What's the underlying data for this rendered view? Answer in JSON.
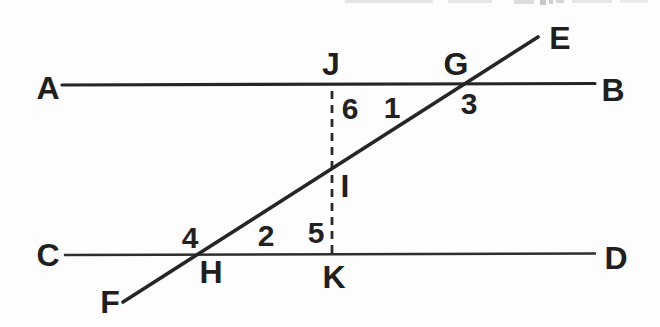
{
  "figure": {
    "description_colors": {
      "ink": "#262626",
      "label_ink": "#1f1f1f",
      "paper": "#fdfdfd",
      "scan_artifact": "#bfbfbf"
    },
    "lines": [
      {
        "name": "line-AB",
        "style": "solid"
      },
      {
        "name": "line-CD",
        "style": "solid"
      },
      {
        "name": "transversal-FE",
        "style": "solid"
      },
      {
        "name": "segment-JK",
        "style": "dashed"
      }
    ]
  },
  "labels": {
    "A": "A",
    "B": "B",
    "C": "C",
    "D": "D",
    "E": "E",
    "F": "F",
    "G": "G",
    "H": "H",
    "I": "I",
    "J": "J",
    "K": "K"
  },
  "angles": {
    "a1": "1",
    "a2": "2",
    "a3": "3",
    "a4": "4",
    "a5": "5",
    "a6": "6"
  }
}
